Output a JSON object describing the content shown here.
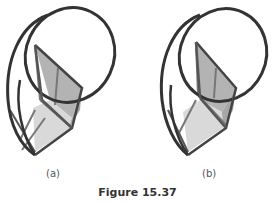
{
  "figure": {
    "caption": "Figure 15.37",
    "panels": [
      {
        "id": "a",
        "label": "(a)"
      },
      {
        "id": "b",
        "label": "(b)"
      }
    ],
    "colors": {
      "stroke": "#333333",
      "face_dark": "#a9a9a9",
      "face_mid": "#bdbdbd",
      "face_light": "#dcdcdc",
      "inner_line": "#777777"
    }
  }
}
